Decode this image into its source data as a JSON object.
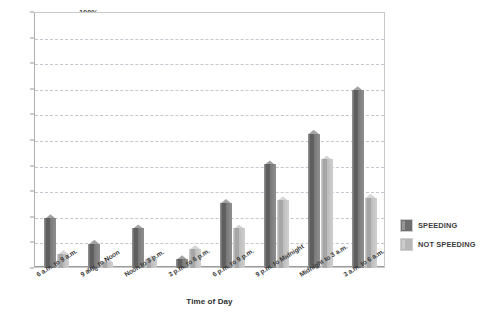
{
  "chart_data": {
    "type": "bar",
    "title": "",
    "xlabel": "Time of Day",
    "ylabel": "",
    "ylim": [
      0,
      100
    ],
    "yunit": "%",
    "grid": true,
    "legend_position": "right",
    "categories": [
      "6 a.m. to 9 a.m.",
      "9 a.m. to Noon",
      "Noon to 3 p.m.",
      "3 p.m. to 6 p.m.",
      "6 p.m. to 9 p.m.",
      "9 p.m. to Midnight",
      "Midnight to 3 a.m.",
      "3 a.m. to 6 a.m."
    ],
    "series": [
      {
        "name": "SPEEDING",
        "color": "#6e6e6e",
        "values": [
          21,
          11,
          17,
          5,
          27,
          42,
          54,
          71
        ]
      },
      {
        "name": "NOT SPEEDING",
        "color": "#b7b7b7",
        "values": [
          7,
          4,
          5,
          9,
          17,
          28,
          44,
          29
        ]
      }
    ],
    "yticks": [
      "0%",
      "10%",
      "20%",
      "30%",
      "40%",
      "50%",
      "60%",
      "70%",
      "80%",
      "90%",
      "100%"
    ]
  },
  "legend": {
    "items": [
      {
        "label": "SPEEDING",
        "color": "#6e6e6e"
      },
      {
        "label": "NOT SPEEDING",
        "color": "#b7b7b7"
      }
    ]
  }
}
